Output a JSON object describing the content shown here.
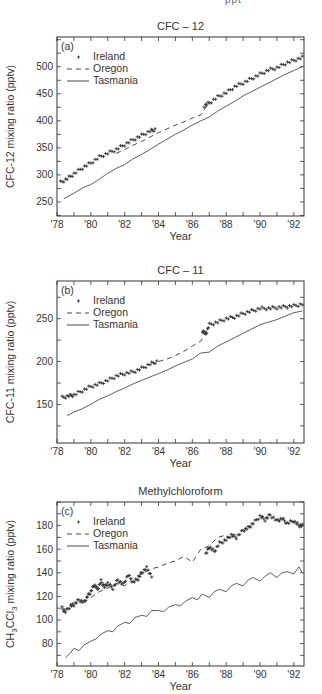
{
  "page": {
    "top_cut_text": "ppt"
  },
  "chart_data": [
    {
      "type": "line",
      "panel_label": "(a)",
      "title": "CFC – 12",
      "xlabel": "Year",
      "ylabel": "CFC-12 mixing ratio (pptv)",
      "ylabel_html": null,
      "xlim": [
        1978,
        1992.6
      ],
      "ylim": [
        224,
        555
      ],
      "xticks": [
        1978,
        1980,
        1982,
        1984,
        1986,
        1988,
        1990,
        1992
      ],
      "xtick_labels": [
        "'78",
        "'80",
        "'82",
        "'84",
        "'86",
        "'88",
        "'90",
        "'92"
      ],
      "yticks": [
        250,
        300,
        350,
        400,
        450,
        500
      ],
      "ytick_labels": [
        "250",
        "300",
        "350",
        "400",
        "450",
        "500"
      ],
      "grid": false,
      "legend": {
        "position": "upper-left",
        "entries": [
          "Ireland",
          "Oregon",
          "Tasmania"
        ]
      },
      "frame": {
        "x": 57,
        "y": 37,
        "w": 247,
        "h": 179
      },
      "series": [
        {
          "name": "Ireland",
          "style": "plus",
          "x": [
            1978.2,
            1978.6,
            1979.0,
            1979.5,
            1980.0,
            1980.5,
            1981.0,
            1981.5,
            1982.0,
            1982.5,
            1983.0,
            1983.5,
            1983.8,
            1986.7,
            1987.0,
            1987.5,
            1988.0,
            1988.5,
            1989.0,
            1989.5,
            1990.0,
            1990.5,
            1991.0,
            1991.5,
            1992.0,
            1992.5
          ],
          "values": [
            286,
            293,
            302,
            313,
            322,
            333,
            340,
            347,
            356,
            365,
            373,
            381,
            384,
            428,
            433,
            444,
            452,
            463,
            470,
            478,
            486,
            494,
            498,
            506,
            512,
            517
          ]
        },
        {
          "name": "Oregon",
          "style": "dashed",
          "x": [
            1981.5,
            1982.0,
            1982.5,
            1983.0,
            1983.5,
            1984.0,
            1984.5,
            1985.0,
            1985.5,
            1986.0,
            1986.5,
            1986.9
          ],
          "values": [
            340,
            347,
            355,
            362,
            370,
            378,
            385,
            392,
            398,
            405,
            411,
            430
          ]
        },
        {
          "name": "Tasmania",
          "style": "solid",
          "x": [
            1978.4,
            1979.0,
            1979.5,
            1980.0,
            1980.5,
            1981.0,
            1981.5,
            1982.0,
            1982.5,
            1983.0,
            1983.5,
            1984.0,
            1984.5,
            1985.0,
            1985.5,
            1986.0,
            1986.5,
            1987.0,
            1987.5,
            1988.0,
            1988.5,
            1989.0,
            1989.5,
            1990.0,
            1990.5,
            1991.0,
            1991.5,
            1992.0,
            1992.5
          ],
          "values": [
            256,
            266,
            276,
            282,
            292,
            303,
            312,
            319,
            330,
            338,
            347,
            357,
            366,
            375,
            383,
            392,
            400,
            407,
            418,
            427,
            436,
            446,
            454,
            462,
            470,
            478,
            486,
            493,
            500
          ]
        }
      ]
    },
    {
      "type": "line",
      "panel_label": "(b)",
      "title": "CFC – 11",
      "xlabel": "Year",
      "ylabel": "CFC-11 mixing ratio (pptv)",
      "xlim": [
        1978,
        1992.6
      ],
      "ylim": [
        105,
        294
      ],
      "xticks": [
        1978,
        1980,
        1982,
        1984,
        1986,
        1988,
        1990,
        1992
      ],
      "xtick_labels": [
        "'78",
        "'80",
        "'82",
        "'84",
        "'86",
        "'88",
        "'90",
        "'92"
      ],
      "yticks": [
        150,
        200,
        250
      ],
      "ytick_labels": [
        "150",
        "200",
        "250"
      ],
      "grid": false,
      "legend": {
        "position": "upper-left",
        "entries": [
          "Ireland",
          "Oregon",
          "Tasmania"
        ]
      },
      "frame": {
        "x": 57,
        "y": 281,
        "w": 247,
        "h": 162
      },
      "series": [
        {
          "name": "Ireland",
          "style": "plus",
          "x": [
            1978.3,
            1978.7,
            1979.0,
            1979.5,
            1980.0,
            1980.5,
            1981.0,
            1981.5,
            1982.0,
            1982.5,
            1983.0,
            1983.5,
            1983.9,
            1986.6,
            1986.8,
            1987.0,
            1987.5,
            1988.0,
            1988.5,
            1989.0,
            1989.5,
            1990.0,
            1990.5,
            1991.0,
            1991.5,
            1992.0,
            1992.5
          ],
          "values": [
            158,
            160,
            161,
            166,
            171,
            174,
            178,
            183,
            186,
            188,
            192,
            197,
            200,
            236,
            232,
            243,
            246,
            250,
            252,
            256,
            259,
            262,
            262,
            263,
            264,
            265,
            267
          ]
        },
        {
          "name": "Oregon",
          "style": "dashed",
          "x": [
            1984.0,
            1984.5,
            1985.0,
            1985.5,
            1986.0,
            1986.5,
            1986.9
          ],
          "values": [
            200,
            203,
            207,
            212,
            218,
            224,
            238
          ]
        },
        {
          "name": "Tasmania",
          "style": "solid",
          "x": [
            1978.6,
            1979.0,
            1979.5,
            1980.0,
            1980.5,
            1981.0,
            1981.5,
            1982.0,
            1982.5,
            1983.0,
            1983.5,
            1984.0,
            1984.5,
            1985.0,
            1985.5,
            1986.0,
            1986.5,
            1987.0,
            1987.5,
            1988.0,
            1988.5,
            1989.0,
            1989.5,
            1990.0,
            1990.5,
            1991.0,
            1991.5,
            1992.0,
            1992.5
          ],
          "values": [
            137,
            141,
            145,
            150,
            156,
            160,
            165,
            169,
            174,
            178,
            182,
            186,
            190,
            195,
            199,
            203,
            210,
            211,
            218,
            223,
            228,
            233,
            238,
            243,
            246,
            249,
            253,
            257,
            259
          ]
        }
      ]
    },
    {
      "type": "line",
      "panel_label": "(c)",
      "title": "Methylchloroform",
      "xlabel": "Year",
      "ylabel": "CH3CCl3 mixing ratio (pptv)",
      "ylabel_parts": [
        "CH",
        "3",
        "CCl",
        "3",
        " mixing ratio (pptv)"
      ],
      "xlim": [
        1978,
        1992.6
      ],
      "ylim": [
        61,
        200
      ],
      "xticks": [
        1978,
        1980,
        1982,
        1984,
        1986,
        1988,
        1990,
        1992
      ],
      "xtick_labels": [
        "'78",
        "'80",
        "'82",
        "'84",
        "'86",
        "'88",
        "'90",
        "'92"
      ],
      "yticks": [
        80,
        100,
        120,
        140,
        160,
        180
      ],
      "ytick_labels": [
        "80",
        "100",
        "120",
        "140",
        "160",
        "180"
      ],
      "grid": false,
      "legend": {
        "position": "upper-left",
        "entries": [
          "Ireland",
          "Oregon",
          "Tasmania"
        ]
      },
      "frame": {
        "x": 57,
        "y": 502,
        "w": 247,
        "h": 164
      },
      "series": [
        {
          "name": "Ireland",
          "style": "plus",
          "x": [
            1978.3,
            1978.5,
            1978.8,
            1979.0,
            1979.3,
            1979.6,
            1979.8,
            1980.0,
            1980.2,
            1980.4,
            1980.6,
            1980.8,
            1981.0,
            1981.3,
            1981.6,
            1981.9,
            1982.2,
            1982.5,
            1982.8,
            1983.0,
            1983.3,
            1983.6,
            1986.8,
            1987.0,
            1987.3,
            1987.6,
            1988.0,
            1988.3,
            1988.6,
            1989.0,
            1989.3,
            1989.6,
            1990.0,
            1990.3,
            1990.6,
            1991.0,
            1991.3,
            1991.6,
            1992.0,
            1992.3,
            1992.5
          ],
          "values": [
            110,
            107,
            112,
            113,
            117,
            115,
            120,
            124,
            130,
            126,
            133,
            128,
            131,
            127,
            134,
            130,
            138,
            132,
            135,
            140,
            144,
            137,
            156,
            162,
            158,
            165,
            168,
            172,
            170,
            176,
            178,
            182,
            188,
            185,
            189,
            184,
            186,
            182,
            184,
            180,
            180
          ]
        },
        {
          "name": "Oregon",
          "style": "dashed",
          "x": [
            1980.0,
            1980.5,
            1981.0,
            1981.5,
            1982.0,
            1982.5,
            1983.0,
            1983.5,
            1984.0,
            1984.5,
            1985.0,
            1985.5,
            1986.0,
            1986.5,
            1987.0,
            1987.5,
            1988.0
          ],
          "values": [
            119,
            124,
            127,
            131,
            129,
            136,
            139,
            143,
            145,
            148,
            150,
            154,
            149,
            160,
            163,
            170,
            172
          ]
        },
        {
          "name": "Tasmania",
          "style": "solid",
          "x": [
            1978.5,
            1978.8,
            1979.0,
            1979.3,
            1979.6,
            1980.0,
            1980.3,
            1980.6,
            1981.0,
            1981.3,
            1981.6,
            1982.0,
            1982.3,
            1982.6,
            1983.0,
            1983.3,
            1983.6,
            1984.0,
            1984.3,
            1984.6,
            1985.0,
            1985.3,
            1985.6,
            1986.0,
            1986.3,
            1986.6,
            1987.0,
            1987.3,
            1987.6,
            1988.0,
            1988.3,
            1988.6,
            1989.0,
            1989.3,
            1989.6,
            1990.0,
            1990.3,
            1990.6,
            1991.0,
            1991.3,
            1991.6,
            1992.0,
            1992.3,
            1992.5
          ],
          "values": [
            68,
            72,
            76,
            74,
            79,
            82,
            84,
            88,
            91,
            90,
            95,
            98,
            97,
            102,
            104,
            103,
            108,
            108,
            107,
            111,
            113,
            112,
            116,
            119,
            117,
            122,
            119,
            124,
            126,
            124,
            129,
            131,
            129,
            134,
            136,
            133,
            137,
            140,
            136,
            140,
            141,
            139,
            145,
            140
          ]
        }
      ]
    }
  ]
}
